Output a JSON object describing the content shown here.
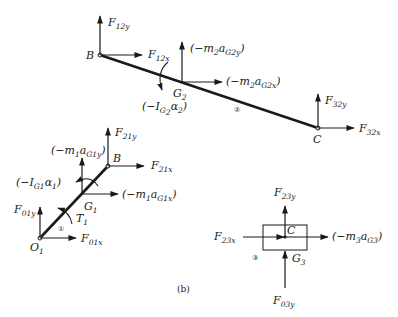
{
  "caption": "(b)",
  "link2": {
    "number": "②",
    "points": {
      "B": "B",
      "C": "C",
      "G": "G"
    },
    "labels": {
      "F12y": [
        "F",
        "12y"
      ],
      "F12x": [
        "F",
        "12x"
      ],
      "m2aG2y": [
        "(−m",
        "2",
        "a",
        "G2y",
        ")"
      ],
      "m2aG2x": [
        "(−m",
        "2",
        "a",
        "G2x",
        ")"
      ],
      "IG2a2": [
        "(−I",
        "G",
        "2",
        "α",
        "2",
        ")"
      ],
      "G2_sub": "2",
      "F32y": [
        "F",
        "32y"
      ],
      "F32x": [
        "F",
        "32x"
      ]
    }
  },
  "link1": {
    "number": "①",
    "points": {
      "O": "O",
      "O_sub": "1",
      "B": "B",
      "G": "G",
      "G_sub": "1"
    },
    "labels": {
      "F21y": [
        "F",
        "21y"
      ],
      "F21x": [
        "F",
        "21x"
      ],
      "m1aG1y": [
        "(−m",
        "1",
        "a",
        "G1y",
        ")"
      ],
      "m1aG1x": [
        "(−m",
        "1",
        "a",
        "G1x",
        ")"
      ],
      "IG1a1": [
        "(−I",
        "G1",
        "α",
        "1",
        ")"
      ],
      "T1": [
        "T",
        "1"
      ],
      "F01y": [
        "F",
        "01y"
      ],
      "F01x": [
        "F",
        "01x"
      ]
    }
  },
  "slider3": {
    "number": "③",
    "points": {
      "C": "C",
      "G": "G",
      "G_sub": "3"
    },
    "labels": {
      "F23y": [
        "F",
        "23y"
      ],
      "F23x": [
        "F",
        "23x"
      ],
      "m3aG3": [
        "(−m",
        "3",
        "a",
        "G3",
        ")"
      ],
      "F03y": [
        "F",
        "03y"
      ]
    }
  }
}
